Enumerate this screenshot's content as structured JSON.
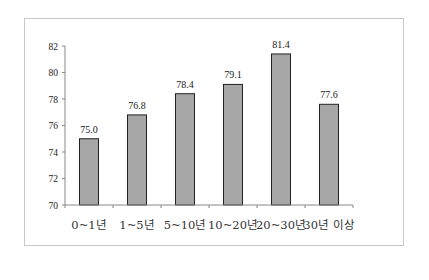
{
  "chart_data": {
    "type": "bar",
    "title": "",
    "xlabel": "",
    "ylabel": "",
    "categories": [
      "0~1년",
      "1~5년",
      "5~10년",
      "10~20년",
      "20~30년",
      "30년 이상"
    ],
    "values": [
      75.0,
      76.8,
      78.4,
      79.1,
      81.4,
      77.6
    ],
    "value_labels": [
      "75.0",
      "76.8",
      "78.4",
      "79.1",
      "81.4",
      "77.6"
    ],
    "ylim": [
      70,
      82
    ],
    "yticks": [
      "70",
      "72",
      "74",
      "76",
      "78",
      "80",
      "82"
    ],
    "grid": false,
    "legend": null,
    "bar_color": "#a6a6a6",
    "bar_edge_color": "#222222"
  }
}
